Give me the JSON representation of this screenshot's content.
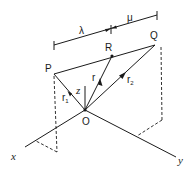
{
  "diagram": {
    "type": "vector-geometry",
    "points": {
      "P": {
        "label": "P",
        "x": 54,
        "y": 74
      },
      "Q": {
        "label": "Q",
        "x": 155,
        "y": 45
      },
      "R": {
        "label": "R",
        "x": 112,
        "y": 56
      },
      "O": {
        "label": "O",
        "x": 85,
        "y": 110
      }
    },
    "vectors": {
      "r1": {
        "label": "r",
        "subscript": "1",
        "from": "O",
        "to": "P"
      },
      "r": {
        "label": "r",
        "subscript": "",
        "from": "O",
        "to": "R"
      },
      "r2": {
        "label": "r",
        "subscript": "2",
        "from": "O",
        "to": "Q"
      }
    },
    "axes": {
      "x": {
        "label": "x"
      },
      "y": {
        "label": "y"
      },
      "z": {
        "label": "z"
      }
    },
    "dimensions": {
      "lambda": {
        "label": "λ",
        "segment": "PR"
      },
      "mu": {
        "label": "μ",
        "segment": "RQ"
      }
    }
  }
}
